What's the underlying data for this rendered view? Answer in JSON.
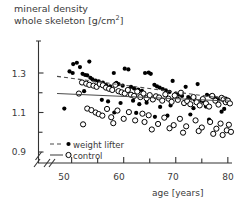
{
  "chart_data": {
    "type": "scatter",
    "title": "mineral density whole skeleton [g/cm2]",
    "title_line1": "mineral density",
    "title_line2": "whole skeleton",
    "title_units": "[g/cm",
    "title_units_sup": "2",
    "title_units_close": "]",
    "xlabel": "age [years]",
    "ylabel": "",
    "xlim": [
      46,
      81
    ],
    "ylim": [
      0.86,
      1.4
    ],
    "x_ticks_major": [
      50,
      60,
      70,
      80
    ],
    "x_ticks_minor": [
      55,
      65,
      75
    ],
    "x_tick_labels": [
      "50",
      "60",
      "70",
      "80"
    ],
    "y_ticks_major": [
      0.9,
      1.1,
      1.3
    ],
    "y_ticks_minor": [
      1.0,
      1.2
    ],
    "y_tick_labels": [
      "0.9",
      "1.1",
      "1.3"
    ],
    "axis_break_x": true,
    "axis_break_y": true,
    "grid": false,
    "legend_position": "bottom-left",
    "series": [
      {
        "name": "weight lifter",
        "marker": "filled-circle",
        "line": "dashed",
        "color": "#000000",
        "trend": {
          "x0": 47.2,
          "y0": 1.283,
          "x1": 80.2,
          "y1": 1.168
        },
        "points": [
          [
            50.3,
            1.345
          ],
          [
            51.0,
            1.352
          ],
          [
            51.6,
            1.33
          ],
          [
            53.4,
            1.358
          ],
          [
            49.6,
            1.308
          ],
          [
            50.2,
            1.3
          ],
          [
            52.1,
            1.296
          ],
          [
            52.6,
            1.29
          ],
          [
            53.0,
            1.288
          ],
          [
            53.6,
            1.276
          ],
          [
            54.0,
            1.268
          ],
          [
            54.6,
            1.262
          ],
          [
            55.2,
            1.258
          ],
          [
            56.0,
            1.252
          ],
          [
            56.6,
            1.24
          ],
          [
            57.4,
            1.232
          ],
          [
            58.1,
            1.3
          ],
          [
            58.6,
            1.25
          ],
          [
            59.0,
            1.244
          ],
          [
            59.8,
            1.236
          ],
          [
            60.2,
            1.322
          ],
          [
            60.9,
            1.318
          ],
          [
            61.4,
            1.23
          ],
          [
            62.0,
            1.222
          ],
          [
            62.8,
            1.216
          ],
          [
            63.5,
            1.21
          ],
          [
            64.1,
            1.3
          ],
          [
            64.8,
            1.302
          ],
          [
            65.2,
            1.296
          ],
          [
            65.9,
            1.24
          ],
          [
            66.4,
            1.232
          ],
          [
            66.9,
            1.226
          ],
          [
            67.5,
            1.218
          ],
          [
            68.1,
            1.212
          ],
          [
            68.8,
            1.204
          ],
          [
            69.4,
            1.26
          ],
          [
            70.0,
            1.196
          ],
          [
            70.6,
            1.19
          ],
          [
            71.2,
            1.184
          ],
          [
            71.9,
            1.23
          ],
          [
            72.4,
            1.178
          ],
          [
            73.0,
            1.172
          ],
          [
            73.6,
            1.166
          ],
          [
            74.2,
            1.244
          ],
          [
            74.9,
            1.16
          ],
          [
            75.4,
            1.154
          ],
          [
            76.0,
            1.19
          ],
          [
            76.7,
            1.184
          ],
          [
            77.3,
            1.178
          ],
          [
            77.9,
            1.172
          ],
          [
            78.4,
            1.166
          ],
          [
            79.0,
            1.176
          ],
          [
            79.6,
            1.17
          ],
          [
            80.1,
            1.164
          ],
          [
            48.6,
            1.12
          ],
          [
            52.4,
            1.208
          ],
          [
            55.8,
            1.164
          ],
          [
            57.0,
            1.156
          ],
          [
            59.4,
            1.148
          ],
          [
            61.8,
            1.16
          ],
          [
            63.0,
            1.142
          ],
          [
            64.4,
            1.15
          ],
          [
            67.0,
            1.128
          ],
          [
            69.0,
            1.136
          ],
          [
            71.6,
            1.144
          ],
          [
            73.4,
            1.122
          ],
          [
            75.8,
            1.13
          ],
          [
            78.8,
            1.104
          ],
          [
            79.3,
            1.118
          ],
          [
            66.0,
            1.078
          ],
          [
            68.4,
            1.084
          ],
          [
            72.8,
            1.09
          ],
          [
            76.4,
            1.064
          ],
          [
            62.4,
            1.098
          ],
          [
            58.2,
            1.1
          ]
        ]
      },
      {
        "name": "control",
        "marker": "open-circle",
        "line": "solid",
        "color": "#000000",
        "trend": {
          "x0": 47.2,
          "y0": 1.196,
          "x1": 80.2,
          "y1": 1.158
        },
        "points": [
          [
            52.0,
            1.252
          ],
          [
            52.8,
            1.246
          ],
          [
            53.4,
            1.24
          ],
          [
            54.2,
            1.236
          ],
          [
            54.8,
            1.23
          ],
          [
            55.4,
            1.244
          ],
          [
            56.0,
            1.238
          ],
          [
            56.6,
            1.226
          ],
          [
            57.2,
            1.22
          ],
          [
            57.8,
            1.214
          ],
          [
            58.4,
            1.24
          ],
          [
            59.0,
            1.208
          ],
          [
            59.6,
            1.202
          ],
          [
            60.2,
            1.196
          ],
          [
            60.8,
            1.214
          ],
          [
            61.4,
            1.19
          ],
          [
            62.0,
            1.184
          ],
          [
            62.6,
            1.206
          ],
          [
            63.2,
            1.178
          ],
          [
            63.8,
            1.196
          ],
          [
            64.4,
            1.172
          ],
          [
            65.0,
            1.188
          ],
          [
            65.6,
            1.166
          ],
          [
            66.2,
            1.182
          ],
          [
            66.8,
            1.176
          ],
          [
            67.4,
            1.16
          ],
          [
            68.0,
            1.192
          ],
          [
            68.6,
            1.17
          ],
          [
            69.2,
            1.154
          ],
          [
            69.8,
            1.186
          ],
          [
            70.4,
            1.164
          ],
          [
            71.0,
            1.2
          ],
          [
            71.6,
            1.148
          ],
          [
            72.2,
            1.158
          ],
          [
            72.8,
            1.142
          ],
          [
            73.4,
            1.178
          ],
          [
            74.0,
            1.152
          ],
          [
            74.6,
            1.136
          ],
          [
            75.2,
            1.168
          ],
          [
            75.8,
            1.146
          ],
          [
            76.4,
            1.13
          ],
          [
            77.0,
            1.184
          ],
          [
            77.6,
            1.16
          ],
          [
            78.2,
            1.14
          ],
          [
            78.8,
            1.174
          ],
          [
            79.2,
            1.166
          ],
          [
            79.6,
            1.152
          ],
          [
            80.0,
            1.16
          ],
          [
            80.4,
            1.146
          ],
          [
            51.4,
            1.196
          ],
          [
            53.0,
            1.12
          ],
          [
            53.8,
            1.112
          ],
          [
            54.6,
            1.1
          ],
          [
            55.2,
            1.092
          ],
          [
            55.9,
            1.084
          ],
          [
            56.8,
            1.118
          ],
          [
            57.6,
            1.076
          ],
          [
            58.8,
            1.11
          ],
          [
            60.0,
            1.068
          ],
          [
            61.0,
            1.102
          ],
          [
            62.2,
            1.06
          ],
          [
            63.6,
            1.094
          ],
          [
            64.8,
            1.086
          ],
          [
            66.6,
            1.042
          ],
          [
            67.8,
            1.074
          ],
          [
            69.6,
            1.036
          ],
          [
            70.8,
            1.068
          ],
          [
            72.0,
            1.03
          ],
          [
            73.8,
            1.06
          ],
          [
            75.0,
            1.024
          ],
          [
            76.6,
            1.052
          ],
          [
            77.8,
            1.018
          ],
          [
            78.6,
            1.044
          ],
          [
            79.8,
            1.01
          ],
          [
            80.2,
            1.038
          ],
          [
            52.2,
            1.04
          ],
          [
            58.0,
            1.046
          ],
          [
            64.0,
            1.052
          ],
          [
            65.4,
            1.014
          ],
          [
            68.8,
            1.02
          ],
          [
            74.4,
            1.006
          ],
          [
            71.4,
            0.998
          ],
          [
            77.2,
            0.992
          ],
          [
            79.0,
            0.986
          ],
          [
            80.6,
            1.002
          ]
        ]
      }
    ]
  },
  "legend": {
    "items": [
      {
        "label": "weight lifter",
        "marker": "filled-circle",
        "line": "dashed"
      },
      {
        "label": "control",
        "marker": "open-circle",
        "line": "solid"
      }
    ]
  },
  "axes": {
    "x_label": "age [years]",
    "x_tick_labels": [
      "50",
      "60",
      "70",
      "80"
    ],
    "y_tick_labels": [
      "0.9",
      "1.1",
      "1.3"
    ]
  }
}
